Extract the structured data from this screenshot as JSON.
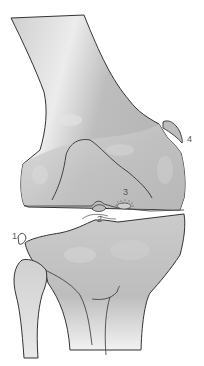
{
  "figure": {
    "colors": {
      "bone_fill": "#c4c4c4",
      "bone_light": "#e2e2e2",
      "bone_dark": "#a9a9a9",
      "outline": "#333333",
      "label": "#555555"
    }
  },
  "labels": [
    {
      "id": "1",
      "text": "1"
    },
    {
      "id": "2",
      "text": "2"
    },
    {
      "id": "3",
      "text": "3"
    },
    {
      "id": "4",
      "text": "4"
    }
  ]
}
